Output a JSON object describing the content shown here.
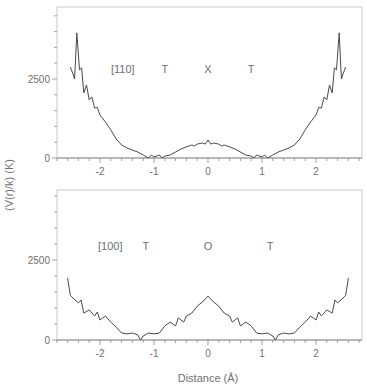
{
  "figure": {
    "ylabel": "(V(r)/k) (K)",
    "xlabel": "Distance (Å)",
    "line_color": "#4a4a4a",
    "axis_color": "#8a8a8a"
  },
  "chart_data": [
    {
      "type": "line",
      "panel": "top",
      "title": "",
      "direction_label": "[110]",
      "annotations": [
        {
          "text": "T",
          "x": -0.8
        },
        {
          "text": "X",
          "x": 0.0
        },
        {
          "text": "T",
          "x": 0.8
        }
      ],
      "xlabel": "",
      "ylabel": "(V(r)/k) (K)",
      "xlim": [
        -2.8,
        2.85
      ],
      "ylim": [
        0,
        4750
      ],
      "xticks": [
        -2,
        -1,
        0,
        1,
        2
      ],
      "xtick_labels": [
        "-2",
        "-1",
        "0",
        "1",
        "2"
      ],
      "yticks": [
        0,
        2500
      ],
      "ytick_labels": [
        "0",
        "2500"
      ],
      "grid": false,
      "series": [
        {
          "name": "[110]",
          "x": [
            -2.55,
            -2.5,
            -2.47,
            -2.43,
            -2.38,
            -2.34,
            -2.3,
            -2.25,
            -2.2,
            -2.15,
            -2.1,
            -2.05,
            -2.0,
            -1.9,
            -1.8,
            -1.7,
            -1.6,
            -1.5,
            -1.4,
            -1.3,
            -1.2,
            -1.1,
            -1.05,
            -1.0,
            -0.9,
            -0.85,
            -0.8,
            -0.7,
            -0.6,
            -0.5,
            -0.4,
            -0.3,
            -0.25,
            -0.2,
            -0.1,
            -0.05,
            0.0,
            0.05,
            0.1,
            0.2,
            0.25,
            0.3,
            0.4,
            0.5,
            0.6,
            0.7,
            0.8,
            0.85,
            0.9,
            1.0,
            1.05,
            1.1,
            1.2,
            1.3,
            1.4,
            1.5,
            1.6,
            1.7,
            1.8,
            1.9,
            2.0,
            2.05,
            2.1,
            2.15,
            2.2,
            2.25,
            2.3,
            2.34,
            2.38,
            2.43,
            2.47,
            2.5,
            2.55
          ],
          "y": [
            2880,
            2660,
            2500,
            3960,
            2790,
            2850,
            2060,
            2310,
            1840,
            1930,
            1580,
            1600,
            1360,
            1140,
            890,
            600,
            410,
            320,
            250,
            190,
            95,
            0,
            95,
            30,
            95,
            0,
            60,
            95,
            190,
            285,
            350,
            410,
            380,
            440,
            475,
            440,
            570,
            440,
            475,
            440,
            380,
            410,
            350,
            285,
            190,
            95,
            60,
            0,
            95,
            30,
            95,
            0,
            95,
            190,
            250,
            320,
            410,
            600,
            890,
            1140,
            1360,
            1600,
            1580,
            1930,
            1840,
            2310,
            2060,
            2850,
            2790,
            3960,
            2500,
            2660,
            2880
          ]
        }
      ]
    },
    {
      "type": "line",
      "panel": "bottom",
      "title": "",
      "direction_label": "[100]",
      "annotations": [
        {
          "text": "T",
          "x": -1.15
        },
        {
          "text": "O",
          "x": 0.0
        },
        {
          "text": "T",
          "x": 1.15
        }
      ],
      "xlabel": "Distance (Å)",
      "ylabel": "(V(r)/k) (K)",
      "xlim": [
        -2.8,
        2.85
      ],
      "ylim": [
        0,
        4750
      ],
      "xticks": [
        -2,
        -1,
        0,
        1,
        2
      ],
      "xtick_labels": [
        "-2",
        "-1",
        "0",
        "1",
        "2"
      ],
      "yticks": [
        0,
        2500
      ],
      "ytick_labels": [
        "0",
        "2500"
      ],
      "grid": false,
      "series": [
        {
          "name": "[100]",
          "x": [
            -2.6,
            -2.55,
            -2.5,
            -2.4,
            -2.35,
            -2.3,
            -2.2,
            -2.1,
            -2.05,
            -2.0,
            -1.9,
            -1.8,
            -1.7,
            -1.6,
            -1.5,
            -1.4,
            -1.3,
            -1.25,
            -1.2,
            -1.1,
            -1.0,
            -0.9,
            -0.8,
            -0.7,
            -0.6,
            -0.55,
            -0.45,
            -0.4,
            -0.3,
            -0.2,
            -0.1,
            -0.05,
            0.0,
            0.05,
            0.1,
            0.2,
            0.3,
            0.4,
            0.45,
            0.55,
            0.6,
            0.7,
            0.8,
            0.9,
            1.0,
            1.1,
            1.2,
            1.25,
            1.3,
            1.4,
            1.5,
            1.6,
            1.7,
            1.8,
            1.9,
            2.0,
            2.05,
            2.1,
            2.2,
            2.3,
            2.35,
            2.4,
            2.5,
            2.55,
            2.6
          ],
          "y": [
            1940,
            1400,
            1310,
            1160,
            1250,
            840,
            940,
            750,
            875,
            625,
            750,
            560,
            400,
            220,
            190,
            220,
            155,
            0,
            125,
            220,
            190,
            220,
            440,
            560,
            440,
            690,
            560,
            750,
            840,
            1060,
            1190,
            1280,
            1375,
            1280,
            1190,
            1060,
            840,
            750,
            560,
            690,
            440,
            560,
            440,
            220,
            190,
            220,
            125,
            0,
            155,
            220,
            190,
            220,
            400,
            560,
            750,
            625,
            875,
            750,
            940,
            840,
            1250,
            1160,
            1310,
            1400,
            1940
          ]
        }
      ]
    }
  ]
}
